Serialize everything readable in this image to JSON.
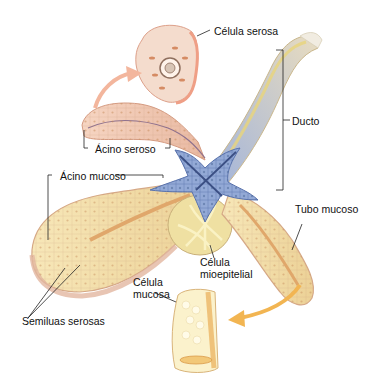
{
  "figure": {
    "labels": {
      "celula_serosa": "Célula serosa",
      "ducto": "Ducto",
      "acino_seroso": "Ácino seroso",
      "acino_mucoso": "Ácino mucoso",
      "tubo_mucoso": "Tubo mucoso",
      "celula_mioepitelial": [
        "Célula",
        "mioepitelial"
      ],
      "celula_mucosa": [
        "Célula",
        "mucosa"
      ],
      "semiluas_serosas": "Semiluas serosas"
    },
    "colors": {
      "serous_pink": "#f0c7b2",
      "serous_outline": "#d9a08a",
      "mucous_yellow": "#f3dfa8",
      "mucous_outline": "#d8b47c",
      "duct_blue": "#8ea3cf",
      "duct_dark": "#4f6aa6",
      "myoepithelial": "#f0df86",
      "arrow_pink": "#f3b69d",
      "arrow_orange": "#f2b552",
      "leader_line": "#222222"
    }
  }
}
